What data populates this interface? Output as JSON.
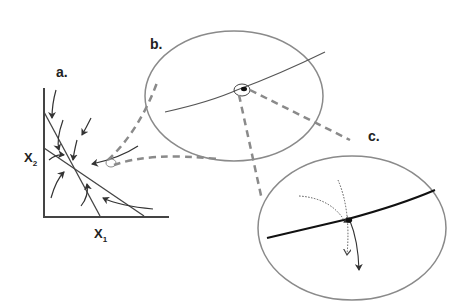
{
  "diagram": {
    "type": "phase-plane zoom-in illustration",
    "panels": [
      {
        "id": "a",
        "label": "a.",
        "description": "Phase plane with two crossing lines (nullclines) and trajectory arrows converging toward their intersection"
      },
      {
        "id": "b",
        "label": "b.",
        "description": "Magnified ellipse view of region near intersection, showing a line with a circled point"
      },
      {
        "id": "c",
        "label": "c.",
        "description": "Further magnified ellipse view showing a bold line with a point and diverging dotted/solid trajectory arrows"
      }
    ],
    "axes": {
      "x_label": "X",
      "x_sub": "1",
      "y_label": "X",
      "y_sub": "2"
    },
    "colors": {
      "line": "#444444",
      "ellipse": "#8a8a8a",
      "dashed": "#8a8a8a",
      "bold_line": "#111111"
    }
  }
}
